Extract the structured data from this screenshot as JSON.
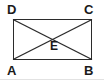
{
  "figure": {
    "kind": "geometry-diagram",
    "shape": "rectangle-with-diagonals",
    "stroke_color": "#2b2b2b",
    "background_color": "#ffffff",
    "label_color": "#1a1a1a",
    "rule_color": "#e2e2e2",
    "rect": {
      "left": 13,
      "top": 19,
      "right": 92,
      "bottom": 60
    },
    "vertices": {
      "top_left": "D",
      "top_right": "C",
      "bottom_left": "A",
      "bottom_right": "B",
      "center": "E"
    },
    "edges": [
      "DC",
      "CB",
      "BA",
      "AD"
    ],
    "diagonals": [
      "DB",
      "AC"
    ],
    "intersection_point": {
      "label": "E",
      "x": 52,
      "y": 39
    }
  }
}
